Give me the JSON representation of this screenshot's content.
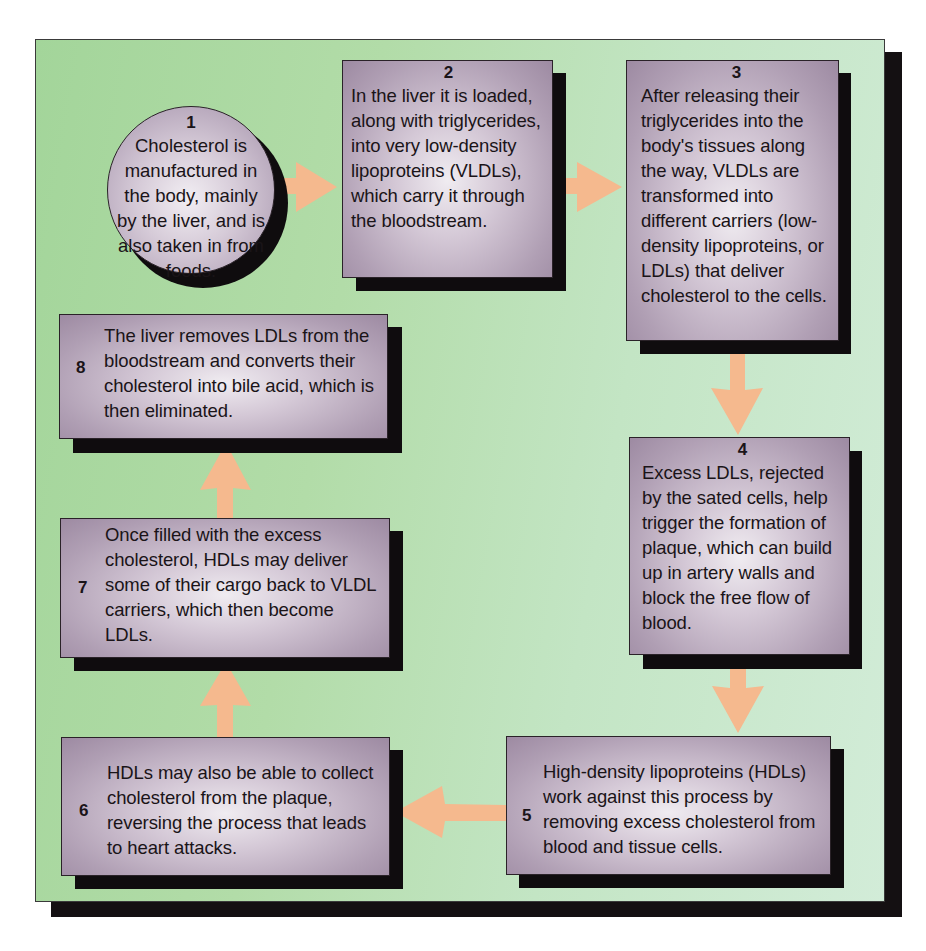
{
  "diagram": {
    "colors": {
      "background_left": "#a3d59a",
      "background_right": "#d2ecd8",
      "box_fill": "#b09fb4",
      "box_highlight": "#f0ecf1",
      "arrow": "#f5b98e",
      "shadow": "#0f0c0e"
    },
    "steps": [
      {
        "number": "1",
        "shape": "circle",
        "text": "Cholesterol is manufactured in the body, mainly by the liver, and is also taken in from foods."
      },
      {
        "number": "2",
        "shape": "box",
        "text": "In the liver it is loaded, along with triglycerides, into very low-density lipoproteins (VLDLs), which carry it through the bloodstream."
      },
      {
        "number": "3",
        "shape": "box",
        "text": "After releasing their triglycerides into the body's tissues along the way, VLDLs are transformed into different carriers (low-density lipoproteins, or LDLs) that deliver cholesterol to the cells."
      },
      {
        "number": "4",
        "shape": "box",
        "text": "Excess LDLs, rejected by the sated cells, help trigger the formation of plaque, which can build up in artery walls and block the free flow of blood."
      },
      {
        "number": "5",
        "shape": "box",
        "text": "High-density lipoproteins (HDLs) work against this process by removing excess cholesterol from blood and tissue cells."
      },
      {
        "number": "6",
        "shape": "box",
        "text": "HDLs may also be able to collect cholesterol from the plaque, reversing the process that leads to heart attacks."
      },
      {
        "number": "7",
        "shape": "box",
        "text": "Once filled with the excess cholesterol, HDLs may deliver some of their cargo back to VLDL carriers, which then become LDLs."
      },
      {
        "number": "8",
        "shape": "box",
        "text": "The liver removes LDLs from the bloodstream and converts their cholesterol into bile acid, which is then eliminated."
      }
    ],
    "arrows": [
      {
        "from": "1",
        "to": "2",
        "direction": "right"
      },
      {
        "from": "2",
        "to": "3",
        "direction": "right"
      },
      {
        "from": "3",
        "to": "4",
        "direction": "down"
      },
      {
        "from": "4",
        "to": "5",
        "direction": "down"
      },
      {
        "from": "5",
        "to": "6",
        "direction": "left"
      },
      {
        "from": "6",
        "to": "7",
        "direction": "up"
      },
      {
        "from": "7",
        "to": "8",
        "direction": "up"
      }
    ]
  }
}
